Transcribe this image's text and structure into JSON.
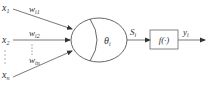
{
  "diagram": {
    "title": "",
    "inputs": [
      {
        "name": "x",
        "sub": "1",
        "weight": "w",
        "weight_sub": "i1"
      },
      {
        "name": "x",
        "sub": "2",
        "weight": "w",
        "weight_sub": "i2"
      },
      {
        "name": "x",
        "sub": "n",
        "weight": "w",
        "weight_sub": "in"
      }
    ],
    "neuron": {
      "threshold": "θ",
      "threshold_sub": "i"
    },
    "sum_output": {
      "name": "S",
      "sub": "i"
    },
    "activation": {
      "label": "f(·)"
    },
    "output": {
      "name": "y",
      "sub": "i"
    },
    "colors": {
      "stroke": "#555555",
      "text": "#333333",
      "background": "#ffffff"
    }
  }
}
